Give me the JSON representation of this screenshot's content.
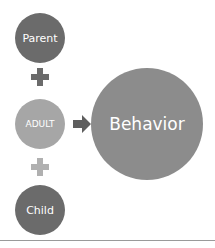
{
  "diagram": {
    "nodes": {
      "parent": {
        "label": "Parent",
        "color": "#6b6b6b"
      },
      "adult": {
        "label": "ADULT",
        "color": "#a6a6a6"
      },
      "child": {
        "label": "Child",
        "color": "#6b6b6b"
      },
      "behavior": {
        "label": "Behavior",
        "color": "#8c8c8c"
      }
    },
    "connectors": {
      "plus_top_color": "#6b6b6b",
      "plus_bottom_color": "#a6a6a6",
      "arrow_color": "#5e5e5e"
    },
    "rule_color": "#9a9a9a"
  }
}
